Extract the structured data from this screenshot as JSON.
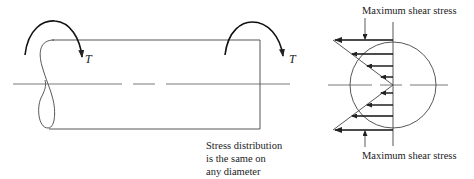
{
  "diagram": {
    "shaft": {
      "torque_left_label": "T",
      "torque_right_label": "T",
      "note_lines": [
        "Stress distribution",
        "is the same on",
        "any diameter"
      ]
    },
    "cross_section": {
      "top_label": "Maximum shear stress",
      "bottom_label": "Maximum shear stress",
      "stress_arrow_count": 8
    },
    "colors": {
      "line": "#333333",
      "text": "#222222",
      "background": "#ffffff"
    }
  }
}
